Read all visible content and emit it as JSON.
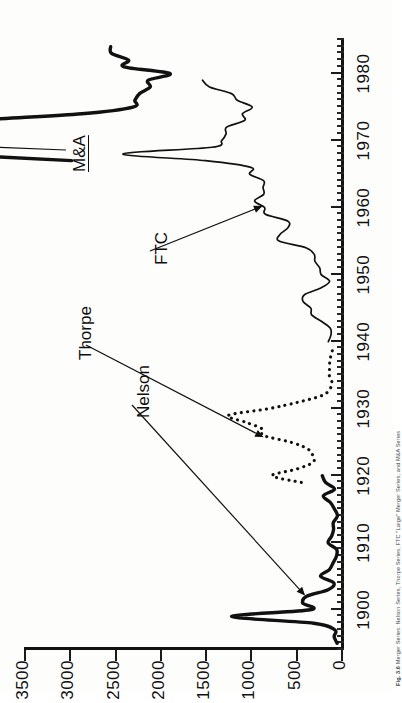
{
  "figure": {
    "caption_label": "Fig. 3.6",
    "caption_text": "Merger Series: Nelson Series, Thorpe Series, FTC \"Large\" Merger Series, and M&A Series"
  },
  "axes": {
    "value_axis": {
      "ticks": [
        0,
        500,
        1000,
        1500,
        2000,
        2500,
        3000,
        3500
      ],
      "tick_labels": [
        "0",
        "500",
        "1000",
        "1500",
        "2000",
        "2500",
        "3000",
        "3500"
      ],
      "min": 0,
      "max": 3500,
      "title": ""
    },
    "year_axis": {
      "ticks": [
        1900,
        1910,
        1920,
        1930,
        1940,
        1950,
        1960,
        1970,
        1980
      ],
      "tick_labels": [
        "1900",
        "1910",
        "1920",
        "1930",
        "1940",
        "1950",
        "1960",
        "1970",
        "1980"
      ],
      "min": 1894,
      "max": 1985,
      "minor_tick_interval": 1,
      "title": ""
    }
  },
  "annotations": [
    {
      "name": "nelson-label",
      "text": "Nelson",
      "underlined": false
    },
    {
      "name": "thorpe-label",
      "text": "Thorpe",
      "underlined": false
    },
    {
      "name": "ftc-label",
      "text": "FTC",
      "underlined": false
    },
    {
      "name": "ma-label",
      "text": "M&A",
      "underlined": true
    }
  ],
  "style": {
    "ink": "#121212",
    "paper": "#fdfdfb"
  },
  "chart_data": {
    "type": "line",
    "title": "Merger Series",
    "xlabel": "",
    "ylabel": "",
    "xlim": [
      1894,
      1985
    ],
    "ylim": [
      0,
      3500
    ],
    "grid": false,
    "legend": "inline-annotations",
    "series": [
      {
        "name": "Nelson",
        "style": "solid-thick",
        "x": [
          1895,
          1896,
          1897,
          1898,
          1899,
          1900,
          1901,
          1902,
          1903,
          1904,
          1905,
          1906,
          1907,
          1908,
          1909,
          1910,
          1911,
          1912,
          1913,
          1914,
          1915,
          1916,
          1917,
          1918,
          1919,
          1920
        ],
        "values": [
          43,
          76,
          69,
          303,
          1208,
          340,
          423,
          379,
          142,
          79,
          226,
          128,
          87,
          50,
          49,
          142,
          103,
          82,
          85,
          39,
          71,
          117,
          195,
          71,
          171,
          206
        ]
      },
      {
        "name": "Thorpe",
        "style": "dotted",
        "x": [
          1919,
          1920,
          1921,
          1922,
          1923,
          1924,
          1925,
          1926,
          1927,
          1928,
          1929,
          1930,
          1931,
          1932,
          1933,
          1934,
          1935,
          1936,
          1937,
          1938,
          1939
        ],
        "values": [
          438,
          760,
          487,
          309,
          311,
          368,
          554,
          856,
          870,
          1058,
          1245,
          799,
          464,
          203,
          120,
          101,
          130,
          126,
          124,
          110,
          87
        ]
      },
      {
        "name": "FTC",
        "style": "solid-thin",
        "x": [
          1940,
          1941,
          1942,
          1943,
          1944,
          1945,
          1946,
          1947,
          1948,
          1949,
          1950,
          1951,
          1952,
          1953,
          1954,
          1955,
          1956,
          1957,
          1958,
          1959,
          1960,
          1961,
          1962,
          1963,
          1964,
          1965,
          1966,
          1967,
          1968,
          1969,
          1970,
          1971,
          1972,
          1973,
          1974,
          1975,
          1976,
          1977,
          1978,
          1979
        ],
        "values": [
          140,
          111,
          118,
          213,
          324,
          333,
          419,
          404,
          223,
          126,
          219,
          235,
          288,
          295,
          387,
          683,
          673,
          585,
          589,
          835,
          844,
          954,
          853,
          861,
          854,
          1008,
          995,
          1496,
          2407,
          1426,
          1318,
          1269,
          1263,
          1064,
          1088,
          981,
          1145,
          1209,
          1452,
          1529
        ]
      },
      {
        "name": "M&A",
        "style": "solid-thick",
        "x": [
          1967,
          1968,
          1969,
          1970,
          1971,
          1972,
          1973,
          1974,
          1975,
          1976,
          1977,
          1978,
          1979,
          1980,
          1981,
          1982,
          1983,
          1984
        ],
        "values": [
          2975,
          4462,
          6107,
          5152,
          4608,
          4801,
          4040,
          2861,
          2297,
          2276,
          2224,
          2106,
          2128,
          1889,
          2395,
          2346,
          2533,
          2543
        ]
      }
    ]
  }
}
